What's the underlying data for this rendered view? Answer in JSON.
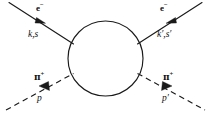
{
  "figure": {
    "kind": "feynman-diagram",
    "title": "",
    "background_color": "#ffffff",
    "line_color": "#1a1a1a",
    "width": 211,
    "height": 117,
    "blob": {
      "name": "loop-blob",
      "shape": "circle",
      "cx": 105.5,
      "cy": 58.5,
      "r": 37.5,
      "stroke": "#1a1a1a",
      "stroke_width": 1.1,
      "fill": "none"
    },
    "legs": [
      {
        "name": "incoming-electron",
        "style": "solid",
        "particle_label": "e",
        "particle_charge": "−",
        "momentum_label": "k,s",
        "arrow_direction": "toward-blob"
      },
      {
        "name": "outgoing-electron",
        "style": "solid",
        "particle_label": "e",
        "particle_charge": "−",
        "momentum_label": "k′,s′",
        "arrow_direction": "away-from-blob"
      },
      {
        "name": "incoming-pion",
        "style": "dashed",
        "particle_label": "π",
        "particle_charge": "+",
        "momentum_label": "p",
        "arrow_direction": "toward-blob"
      },
      {
        "name": "outgoing-pion",
        "style": "dashed",
        "particle_label": "π",
        "particle_charge": "+",
        "momentum_label": "p′",
        "arrow_direction": "away-from-blob"
      }
    ],
    "labels": {
      "electron_in_particle": "e",
      "electron_in_charge": "−",
      "electron_in_momentum": "k,s",
      "electron_out_particle": "e",
      "electron_out_charge": "−",
      "electron_out_momentum": "k′,s′",
      "pion_in_particle": "π",
      "pion_in_charge": "+",
      "pion_in_momentum": "p",
      "pion_out_particle": "π",
      "pion_out_charge": "+",
      "pion_out_momentum": "p′"
    }
  }
}
